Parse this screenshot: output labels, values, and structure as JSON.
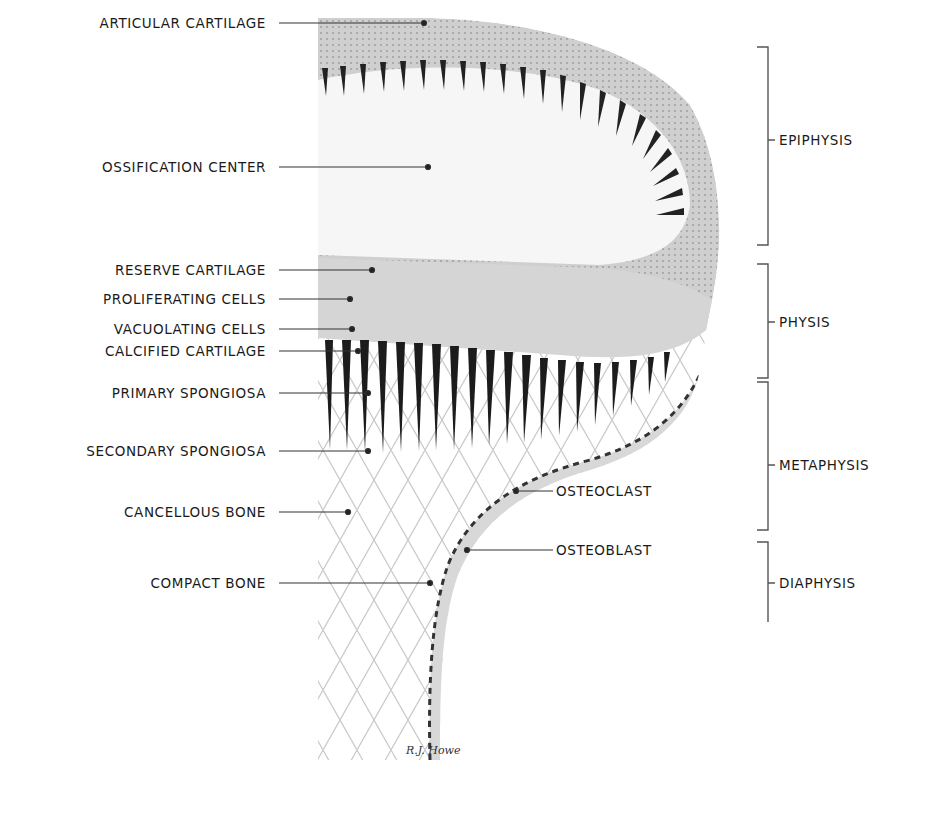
{
  "figure": {
    "type": "anatomical-illustration",
    "colors": {
      "background": "#ffffff",
      "text": "#1a1a1a",
      "leader": "#333333",
      "cartilage": "#c9c9c9",
      "matrix_light": "#dcdcdc",
      "dark_column": "#1c1c1c",
      "cancellous": "#bdbdbd"
    }
  },
  "left_labels": [
    {
      "text": "ARTICULAR CARTILAGE",
      "y": 23,
      "line_end_x": 424
    },
    {
      "text": "OSSIFICATION CENTER",
      "y": 167,
      "line_end_x": 428
    },
    {
      "text": "RESERVE CARTILAGE",
      "y": 270,
      "line_end_x": 372
    },
    {
      "text": "PROLIFERATING CELLS",
      "y": 299,
      "line_end_x": 350
    },
    {
      "text": "VACUOLATING CELLS",
      "y": 329,
      "line_end_x": 352
    },
    {
      "text": "CALCIFIED CARTILAGE",
      "y": 351,
      "line_end_x": 358
    },
    {
      "text": "PRIMARY SPONGIOSA",
      "y": 393,
      "line_end_x": 368
    },
    {
      "text": "SECONDARY SPONGIOSA",
      "y": 451,
      "line_end_x": 368
    },
    {
      "text": "CANCELLOUS BONE",
      "y": 512,
      "line_end_x": 348
    },
    {
      "text": "COMPACT BONE",
      "y": 583,
      "line_end_x": 430
    }
  ],
  "right_labels": [
    {
      "text": "OSTEOCLAST",
      "y": 491,
      "line_start_x": 516
    },
    {
      "text": "OSTEOBLAST",
      "y": 550,
      "line_start_x": 467
    }
  ],
  "regions": [
    {
      "text": "EPIPHYSIS",
      "top": 47,
      "bottom": 245,
      "label_y": 140
    },
    {
      "text": "PHYSIS",
      "top": 264,
      "bottom": 378,
      "label_y": 322
    },
    {
      "text": "METAPHYSIS",
      "top": 382,
      "bottom": 530,
      "label_y": 465
    },
    {
      "text": "DIAPHYSIS",
      "top": 542,
      "bottom": 622,
      "label_y": 583
    }
  ],
  "signature": "R.J. Howe"
}
